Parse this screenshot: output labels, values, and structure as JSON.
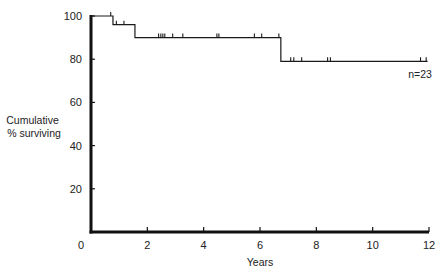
{
  "chart_data": {
    "type": "line",
    "subtype": "kaplan-meier step",
    "title": "",
    "xlabel": "Years",
    "ylabel": "Cumulative\n% surviving",
    "ylabel_lines": [
      "Cumulative",
      "% surviving"
    ],
    "xlim": [
      0,
      12
    ],
    "ylim": [
      0,
      100
    ],
    "xticks": [
      0,
      2,
      4,
      6,
      8,
      10,
      12
    ],
    "yticks": [
      20,
      40,
      60,
      80,
      100
    ],
    "grid": false,
    "legend": null,
    "annotation": "n=23",
    "series": [
      {
        "name": "Cumulative % surviving",
        "steps": [
          {
            "x": 0.0,
            "y": 100
          },
          {
            "x": 0.78,
            "y": 96
          },
          {
            "x": 1.56,
            "y": 90
          },
          {
            "x": 6.74,
            "y": 79
          },
          {
            "x": 11.95,
            "y": 79
          }
        ],
        "censored": [
          {
            "x": 0.7,
            "y": 100
          },
          {
            "x": 0.9,
            "y": 96
          },
          {
            "x": 1.17,
            "y": 96
          },
          {
            "x": 2.4,
            "y": 90
          },
          {
            "x": 2.48,
            "y": 90
          },
          {
            "x": 2.55,
            "y": 90
          },
          {
            "x": 2.62,
            "y": 90
          },
          {
            "x": 2.9,
            "y": 90
          },
          {
            "x": 3.26,
            "y": 90
          },
          {
            "x": 4.47,
            "y": 90
          },
          {
            "x": 4.54,
            "y": 90
          },
          {
            "x": 5.8,
            "y": 90
          },
          {
            "x": 6.06,
            "y": 90
          },
          {
            "x": 6.67,
            "y": 90
          },
          {
            "x": 7.09,
            "y": 79
          },
          {
            "x": 7.2,
            "y": 79
          },
          {
            "x": 7.48,
            "y": 79
          },
          {
            "x": 8.4,
            "y": 79
          },
          {
            "x": 8.5,
            "y": 79
          },
          {
            "x": 11.7,
            "y": 79
          },
          {
            "x": 11.9,
            "y": 79
          }
        ]
      }
    ]
  },
  "colors": {
    "line": "#1a1a1a",
    "axis": "#111111",
    "background": "#ffffff"
  }
}
